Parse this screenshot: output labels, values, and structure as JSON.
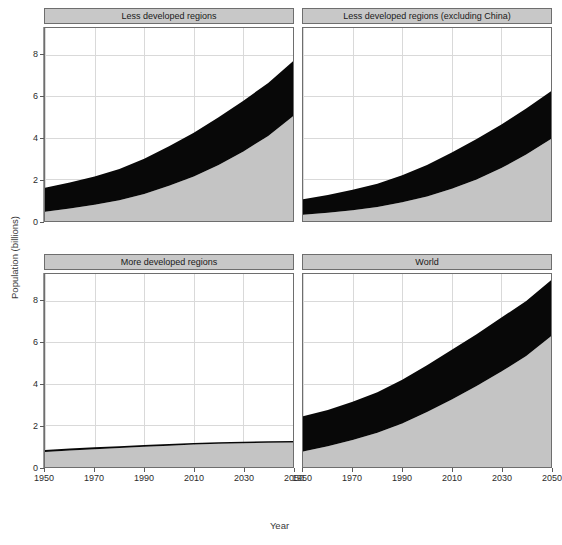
{
  "figure": {
    "clipped_header_text": "",
    "xlabel": "Year",
    "ylabel": "Population (billions)"
  },
  "chart_data": {
    "type": "area",
    "title": "",
    "subtitle": "",
    "xlabel": "Year",
    "ylabel": "Population (billions)",
    "xlim": [
      1950,
      2050
    ],
    "ylim": [
      0,
      9.3
    ],
    "xticks": [
      1950,
      1970,
      1990,
      2010,
      2030,
      2050
    ],
    "yticks": [
      0,
      2,
      4,
      6,
      8
    ],
    "grid": true,
    "legend_position": "none",
    "stacked": true,
    "series_order": [
      "rural",
      "urban"
    ],
    "series_colors": {
      "rural": "#c4c4c4",
      "urban": "#080808"
    },
    "facet_layout": "2x2",
    "x": [
      1950,
      1960,
      1970,
      1980,
      1990,
      2000,
      2010,
      2020,
      2030,
      2040,
      2050
    ],
    "panels": [
      {
        "id": "less-developed-regions",
        "title": "Less developed regions",
        "position": "top-left",
        "series": [
          {
            "name": "rural",
            "color": "#c4c4c4",
            "values": [
              0.45,
              0.6,
              0.78,
              1.0,
              1.3,
              1.7,
              2.15,
              2.7,
              3.35,
              4.1,
              5.05
            ]
          },
          {
            "name": "urban",
            "color": "#080808",
            "values": [
              1.15,
              1.25,
              1.37,
              1.5,
              1.7,
              1.9,
              2.1,
              2.3,
              2.45,
              2.55,
              2.65
            ]
          }
        ],
        "total": [
          1.6,
          1.85,
          2.15,
          2.5,
          3.0,
          3.6,
          4.25,
          5.0,
          5.8,
          6.65,
          7.7
        ]
      },
      {
        "id": "less-developed-regions-excluding-china",
        "title": "Less developed regions (excluding China)",
        "position": "top-right",
        "series": [
          {
            "name": "rural",
            "color": "#c4c4c4",
            "values": [
              0.3,
              0.4,
              0.52,
              0.68,
              0.9,
              1.18,
              1.55,
              2.0,
              2.55,
              3.2,
              3.95
            ]
          },
          {
            "name": "urban",
            "color": "#080808",
            "values": [
              0.75,
              0.85,
              0.98,
              1.12,
              1.3,
              1.52,
              1.75,
              1.95,
              2.1,
              2.22,
              2.3
            ]
          }
        ],
        "total": [
          1.05,
          1.25,
          1.5,
          1.8,
          2.2,
          2.7,
          3.3,
          3.95,
          4.65,
          5.42,
          6.25
        ]
      },
      {
        "id": "more-developed-regions",
        "title": "More developed regions",
        "position": "bottom-left",
        "series": [
          {
            "name": "rural",
            "color": "#c4c4c4",
            "values": [
              0.72,
              0.8,
              0.86,
              0.92,
              0.98,
              1.03,
              1.08,
              1.12,
              1.15,
              1.17,
              1.18
            ]
          },
          {
            "name": "urban",
            "color": "#080808",
            "values": [
              0.1,
              0.09,
              0.09,
              0.08,
              0.08,
              0.08,
              0.08,
              0.07,
              0.07,
              0.07,
              0.07
            ]
          }
        ],
        "total": [
          0.82,
          0.89,
          0.95,
          1.0,
          1.06,
          1.11,
          1.16,
          1.19,
          1.22,
          1.24,
          1.25
        ]
      },
      {
        "id": "world",
        "title": "World",
        "position": "bottom-right",
        "series": [
          {
            "name": "rural",
            "color": "#c4c4c4",
            "values": [
              0.75,
              1.0,
              1.3,
              1.65,
              2.1,
              2.65,
              3.25,
              3.9,
              4.6,
              5.35,
              6.3
            ]
          },
          {
            "name": "urban",
            "color": "#080808",
            "values": [
              1.7,
              1.75,
              1.85,
              1.95,
              2.1,
              2.25,
              2.4,
              2.5,
              2.6,
              2.65,
              2.7
            ]
          }
        ],
        "total": [
          2.45,
          2.75,
          3.15,
          3.6,
          4.2,
          4.9,
          5.65,
          6.4,
          7.2,
          8.0,
          9.0
        ]
      }
    ]
  }
}
